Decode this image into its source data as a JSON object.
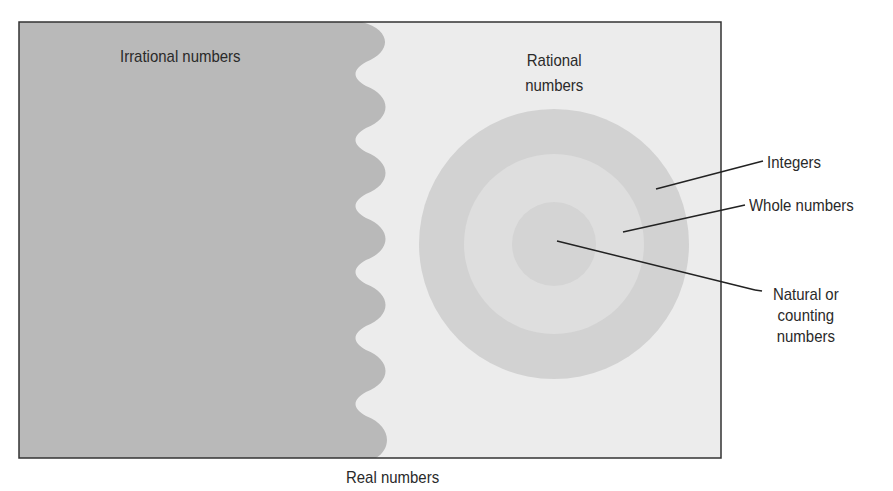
{
  "diagram": {
    "title": "Real numbers",
    "colors": {
      "irrational_fill": "#b9b9b9",
      "rational_fill": "#ececec",
      "integers_ring": "#d2d2d2",
      "whole_ring": "#dedede",
      "natural_core": "#d4d4d4",
      "border": "#333333",
      "leader_line": "#222222"
    },
    "regions": {
      "irrational": {
        "label": "Irrational numbers"
      },
      "rational": {
        "label_line1": "Rational",
        "label_line2": "numbers"
      }
    },
    "callouts": {
      "integers": "Integers",
      "whole": "Whole numbers",
      "natural_line1": "Natural or",
      "natural_line2": "counting",
      "natural_line3": "numbers"
    },
    "caption": "Real numbers"
  }
}
